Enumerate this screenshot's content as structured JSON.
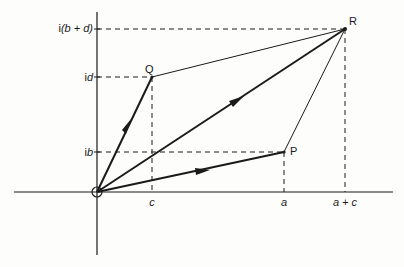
{
  "diagram": {
    "type": "complex-plane-vector-addition",
    "points": {
      "O": {
        "label": "",
        "x": 97,
        "y": 192
      },
      "P": {
        "label": "P",
        "x": 284,
        "y": 152
      },
      "Q": {
        "label": "Q",
        "x": 152,
        "y": 77
      },
      "R": {
        "label": "R",
        "x": 345,
        "y": 29
      }
    },
    "y_ticks": [
      {
        "label_prefix": "i",
        "label_main": "(b + d)",
        "y": 29
      },
      {
        "label_prefix": "i",
        "label_main": "d",
        "y": 77
      },
      {
        "label_prefix": "i",
        "label_main": "b",
        "y": 152
      }
    ],
    "x_ticks": [
      {
        "label": "c",
        "x": 152
      },
      {
        "label": "a",
        "x": 284
      },
      {
        "label": "a + c",
        "x": 345
      }
    ],
    "vectors": [
      {
        "from": "O",
        "to": "Q",
        "arrow": true
      },
      {
        "from": "O",
        "to": "P",
        "arrow": true
      },
      {
        "from": "O",
        "to": "R",
        "arrow": true
      }
    ],
    "edges": [
      {
        "from": "Q",
        "to": "R"
      },
      {
        "from": "P",
        "to": "R"
      }
    ],
    "colors": {
      "stroke": "#1a1a1a",
      "background": "#fdfdfc"
    }
  }
}
